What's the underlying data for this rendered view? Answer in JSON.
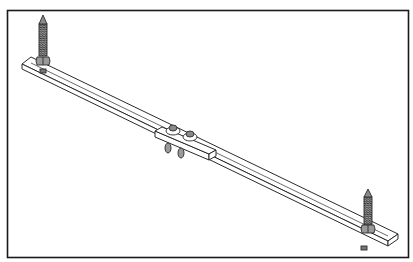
{
  "figure": {
    "frame": {
      "x": 7,
      "y": 10,
      "width": 402,
      "height": 248,
      "stroke": "#1a1a1a"
    },
    "colors": {
      "line": "#2a2a2a",
      "fill": "#ffffff",
      "thread": "#555555",
      "nut": "#8a8a8a",
      "background": "#ffffff"
    },
    "parts": [
      {
        "name": "left-lag-bolt",
        "tip": [
          43,
          17
        ],
        "nut": [
          43,
          64
        ]
      },
      {
        "name": "right-lag-bolt",
        "tip": [
          368,
          190
        ],
        "nut": [
          368,
          232
        ]
      },
      {
        "name": "main-bar",
        "from": [
          22,
          62
        ],
        "to": [
          390,
          243
        ]
      },
      {
        "name": "center-slide-bracket",
        "center": [
          180,
          141
        ]
      },
      {
        "name": "thumb-screws",
        "count": 2
      }
    ]
  }
}
